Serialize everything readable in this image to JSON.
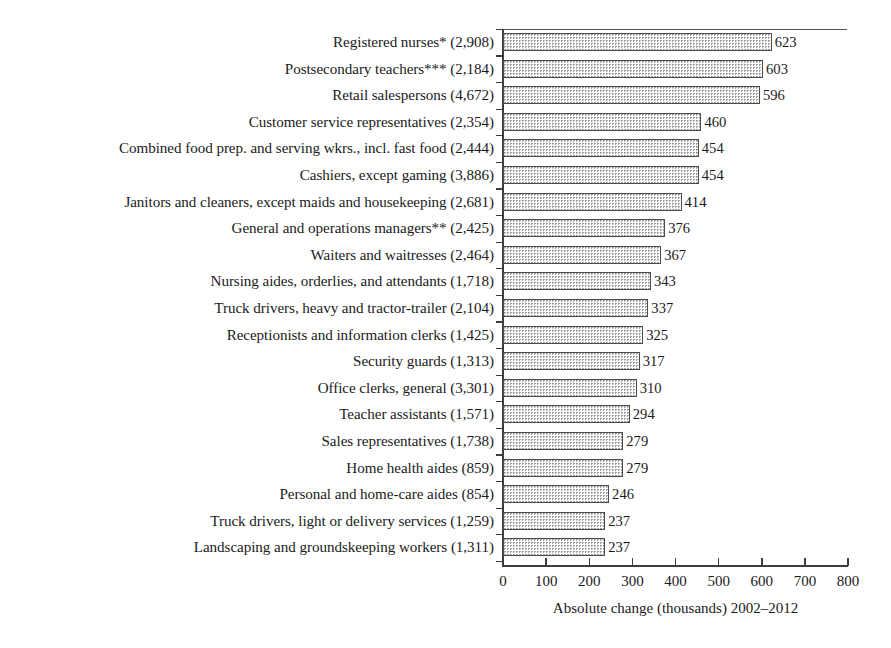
{
  "chart_data": {
    "type": "bar",
    "orientation": "horizontal",
    "title": "",
    "subtitle": "",
    "xlabel": "Absolute change (thousands) 2002–2012",
    "ylabel": "",
    "xlim": [
      0,
      800
    ],
    "xticks": [
      0,
      100,
      200,
      300,
      400,
      500,
      600,
      700,
      800
    ],
    "xtick_labels": [
      "0",
      "100",
      "200",
      "300",
      "400",
      "500",
      "600",
      "700",
      "800"
    ],
    "grid": false,
    "legend": null,
    "bar_style": {
      "fill": "stippled-dotted",
      "fill_color": "#fbfbfb",
      "dot_color": "#9a9a9a",
      "border_color": "#4c4c4c"
    },
    "categories": [
      "Registered nurses* (2,908)",
      "Postsecondary teachers*** (2,184)",
      "Retail salespersons (4,672)",
      "Customer service representatives (2,354)",
      "Combined food prep. and serving wkrs., incl. fast food (2,444)",
      "Cashiers, except gaming (3,886)",
      "Janitors and cleaners, except maids and housekeeping (2,681)",
      "General and operations managers** (2,425)",
      "Waiters and waitresses (2,464)",
      "Nursing aides, orderlies, and attendants (1,718)",
      "Truck drivers, heavy and tractor-trailer (2,104)",
      "Receptionists and information clerks (1,425)",
      "Security guards (1,313)",
      "Office clerks, general (3,301)",
      "Teacher assistants (1,571)",
      "Sales representatives (1,738)",
      "Home health aides (859)",
      "Personal and home-care aides (854)",
      "Truck drivers, light or delivery services (1,259)",
      "Landscaping and groundskeeping workers (1,311)"
    ],
    "values": [
      623,
      603,
      596,
      460,
      454,
      454,
      414,
      376,
      367,
      343,
      337,
      325,
      317,
      310,
      294,
      279,
      279,
      246,
      237,
      237
    ],
    "value_labels": [
      "623",
      "603",
      "596",
      "460",
      "454",
      "454",
      "414",
      "376",
      "367",
      "343",
      "337",
      "325",
      "317",
      "310",
      "294",
      "279",
      "279",
      "246",
      "237",
      "237"
    ]
  }
}
